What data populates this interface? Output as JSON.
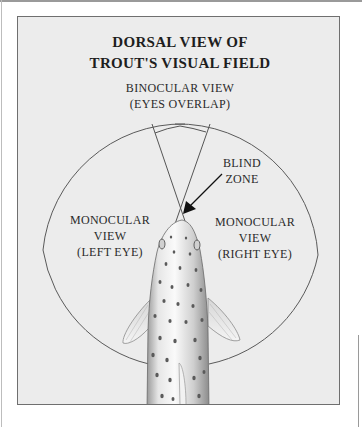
{
  "title": {
    "line1": "DORSAL VIEW OF",
    "line2": "TROUT'S VISUAL FIELD"
  },
  "binocular": {
    "line1": "BINOCULAR VIEW",
    "line2": "(EYES OVERLAP)"
  },
  "blind_zone": {
    "line1": "BLIND",
    "line2": "ZONE"
  },
  "monocular_left": {
    "line1": "MONOCULAR",
    "line2": "VIEW",
    "line3": "(LEFT EYE)"
  },
  "monocular_right": {
    "line1": "MONOCULAR",
    "line2": "VIEW",
    "line3": "(RIGHT EYE)"
  },
  "colors": {
    "panel_fill": "#ececec",
    "panel_border": "#6f6f6f",
    "line": "#555555",
    "text": "#222222",
    "fish_body": "#d9d9d9",
    "fish_spots": "#5a5a5a"
  },
  "icons": {
    "arrow": "arrow-pointing-to-blind-zone",
    "fish": "trout-dorsal-illustration"
  }
}
